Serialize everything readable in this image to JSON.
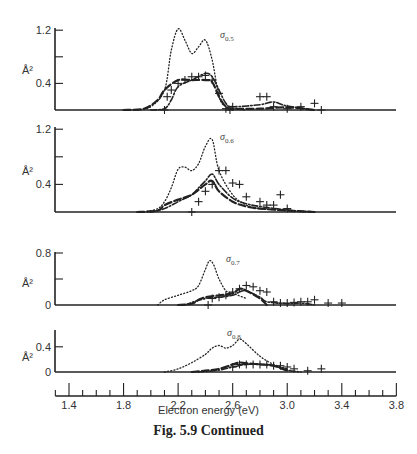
{
  "chart_data": [
    {
      "type": "line",
      "panel_label": "σ0.5",
      "ylabel": "Å²",
      "yticks": [
        "1.2",
        "0.4"
      ],
      "ylim": [
        0,
        1.25
      ],
      "xlim": [
        1.3,
        3.8
      ],
      "series": [
        {
          "name": "dotted",
          "x": [
            1.9,
            2.0,
            2.1,
            2.15,
            2.2,
            2.25,
            2.3,
            2.35,
            2.4,
            2.45,
            2.5,
            2.55,
            2.6,
            2.7
          ],
          "y": [
            0,
            0.05,
            0.3,
            0.9,
            1.22,
            1.05,
            0.85,
            0.95,
            1.05,
            0.75,
            0.2,
            0.05,
            0.02,
            0
          ]
        },
        {
          "name": "dashed",
          "x": [
            1.8,
            1.95,
            2.05,
            2.1,
            2.2,
            2.3,
            2.4,
            2.45,
            2.5,
            2.55,
            2.6,
            2.8,
            3.0,
            3.2
          ],
          "y": [
            0,
            0.02,
            0.15,
            0.3,
            0.45,
            0.45,
            0.45,
            0.42,
            0.2,
            0.05,
            0.02,
            0.02,
            0.04,
            0
          ]
        },
        {
          "name": "dash-dot",
          "x": [
            2.0,
            2.1,
            2.15,
            2.2,
            2.3,
            2.4,
            2.45,
            2.5,
            2.55,
            2.6,
            2.8,
            2.9,
            3.0,
            3.2
          ],
          "y": [
            0,
            0.02,
            0.15,
            0.35,
            0.45,
            0.55,
            0.5,
            0.3,
            0.1,
            0.05,
            0.08,
            0.12,
            0.06,
            0
          ]
        },
        {
          "name": "experiment",
          "marker": "+",
          "x": [
            2.1,
            2.12,
            2.15,
            2.2,
            2.25,
            2.3,
            2.35,
            2.4,
            2.45,
            2.5,
            2.55,
            2.58,
            2.6,
            2.8,
            2.85,
            2.9,
            3.0,
            3.1,
            3.2,
            3.25
          ],
          "y": [
            0,
            0.2,
            0.3,
            0.4,
            0.45,
            0.5,
            0.5,
            0.52,
            0.45,
            0.25,
            0.02,
            0,
            0.05,
            0.2,
            0.2,
            0.05,
            0.02,
            0.05,
            0.1,
            0
          ]
        }
      ]
    },
    {
      "type": "line",
      "panel_label": "σ0.6",
      "ylabel": "Å²",
      "yticks": [
        "1.2",
        "0.4"
      ],
      "ylim": [
        0,
        1.25
      ],
      "xlim": [
        1.3,
        3.8
      ],
      "series": [
        {
          "name": "dotted",
          "x": [
            1.95,
            2.05,
            2.1,
            2.15,
            2.2,
            2.25,
            2.3,
            2.35,
            2.4,
            2.45,
            2.5,
            2.6,
            2.7,
            2.8,
            3.0,
            3.2
          ],
          "y": [
            0,
            0.05,
            0.15,
            0.35,
            0.62,
            0.65,
            0.6,
            0.7,
            0.95,
            1.05,
            0.6,
            0.25,
            0.1,
            0.05,
            0.02,
            0
          ]
        },
        {
          "name": "dashed",
          "x": [
            1.9,
            2.05,
            2.1,
            2.2,
            2.3,
            2.4,
            2.45,
            2.5,
            2.6,
            2.7,
            2.8,
            3.0,
            3.2
          ],
          "y": [
            0,
            0.02,
            0.1,
            0.18,
            0.25,
            0.4,
            0.45,
            0.3,
            0.15,
            0.08,
            0.05,
            0.02,
            0
          ]
        },
        {
          "name": "dash-dot",
          "x": [
            2.0,
            2.1,
            2.2,
            2.3,
            2.35,
            2.4,
            2.45,
            2.5,
            2.6,
            2.7,
            2.8,
            3.0,
            3.2
          ],
          "y": [
            0,
            0.05,
            0.15,
            0.25,
            0.35,
            0.45,
            0.55,
            0.4,
            0.2,
            0.12,
            0.08,
            0.03,
            0
          ]
        },
        {
          "name": "experiment",
          "marker": "+",
          "x": [
            2.3,
            2.35,
            2.4,
            2.45,
            2.5,
            2.55,
            2.6,
            2.65,
            2.7,
            2.8,
            2.85,
            2.9,
            2.95,
            3.0
          ],
          "y": [
            0,
            0.15,
            0.3,
            0.4,
            0.6,
            0.6,
            0.42,
            0.4,
            0.22,
            0.15,
            0.1,
            0.1,
            0.25,
            0.05
          ]
        }
      ]
    },
    {
      "type": "line",
      "panel_label": "σ0.7",
      "ylabel": "Å²",
      "yticks": [
        "0.8",
        "0"
      ],
      "ylim": [
        0,
        0.8
      ],
      "xlim": [
        1.3,
        3.8
      ],
      "series": [
        {
          "name": "dotted",
          "x": [
            2.05,
            2.1,
            2.2,
            2.3,
            2.35,
            2.4,
            2.43,
            2.46,
            2.5,
            2.55,
            2.6,
            2.7
          ],
          "y": [
            0,
            0.08,
            0.15,
            0.22,
            0.3,
            0.55,
            0.68,
            0.62,
            0.4,
            0.22,
            0.18,
            0.1
          ]
        },
        {
          "name": "dashed",
          "x": [
            2.2,
            2.3,
            2.35,
            2.4,
            2.5,
            2.6,
            2.65,
            2.7,
            2.8,
            2.85
          ],
          "y": [
            0,
            0.02,
            0.08,
            0.12,
            0.15,
            0.18,
            0.25,
            0.22,
            0.1,
            0
          ]
        },
        {
          "name": "dash-dot",
          "x": [
            2.25,
            2.3,
            2.4,
            2.5,
            2.6,
            2.65,
            2.7,
            2.8,
            2.85,
            3.0,
            3.1,
            3.2
          ],
          "y": [
            0,
            0.04,
            0.1,
            0.12,
            0.15,
            0.2,
            0.22,
            0.12,
            0.05,
            0.02,
            0.03,
            0
          ]
        },
        {
          "name": "experiment",
          "marker": "+",
          "x": [
            2.42,
            2.45,
            2.5,
            2.55,
            2.6,
            2.65,
            2.7,
            2.75,
            2.8,
            2.85,
            2.9,
            2.95,
            3.0,
            3.05,
            3.1,
            3.15,
            3.2,
            3.3,
            3.4
          ],
          "y": [
            0,
            0.1,
            0.12,
            0.15,
            0.2,
            0.25,
            0.3,
            0.28,
            0.22,
            0.2,
            0.05,
            0.03,
            0.03,
            0.04,
            0.05,
            0.05,
            0.08,
            0.03,
            0.03
          ]
        }
      ]
    },
    {
      "type": "line",
      "panel_label": "σ0.8",
      "ylabel": "Å²",
      "yticks": [
        "0.4",
        "0"
      ],
      "ylim": [
        0,
        0.6
      ],
      "xlim": [
        1.3,
        3.8
      ],
      "series": [
        {
          "name": "dotted",
          "x": [
            2.1,
            2.2,
            2.3,
            2.4,
            2.45,
            2.5,
            2.55,
            2.6,
            2.65,
            2.7,
            2.8,
            2.9,
            3.0
          ],
          "y": [
            0,
            0.05,
            0.15,
            0.28,
            0.38,
            0.42,
            0.38,
            0.42,
            0.52,
            0.45,
            0.25,
            0.12,
            0.05
          ]
        },
        {
          "name": "dashed",
          "x": [
            2.3,
            2.4,
            2.5,
            2.6,
            2.65,
            2.7,
            2.8,
            2.9,
            3.0
          ],
          "y": [
            0,
            0.02,
            0.05,
            0.12,
            0.15,
            0.14,
            0.12,
            0.1,
            0.02
          ]
        },
        {
          "name": "dash-dot",
          "x": [
            2.35,
            2.5,
            2.6,
            2.7,
            2.8,
            2.9,
            3.0,
            3.1
          ],
          "y": [
            0,
            0.03,
            0.08,
            0.12,
            0.12,
            0.1,
            0.03,
            0
          ]
        },
        {
          "name": "experiment",
          "marker": "+",
          "x": [
            2.6,
            2.65,
            2.7,
            2.75,
            2.8,
            2.85,
            2.9,
            2.95,
            3.0,
            3.05,
            3.15,
            3.25
          ],
          "y": [
            0.08,
            0.12,
            0.12,
            0.12,
            0.12,
            0.12,
            0.1,
            0.1,
            0.08,
            0.05,
            0.02,
            0.05
          ]
        }
      ]
    }
  ],
  "xaxis": {
    "label": "Electron energy (eV)",
    "ticks": [
      "1.4",
      "1.8",
      "2.2",
      "2.6",
      "3.0",
      "3.4",
      "3.8"
    ],
    "range": [
      1.3,
      3.8
    ],
    "minor_step": 0.1
  },
  "caption": "Fig. 5.9   Continued"
}
